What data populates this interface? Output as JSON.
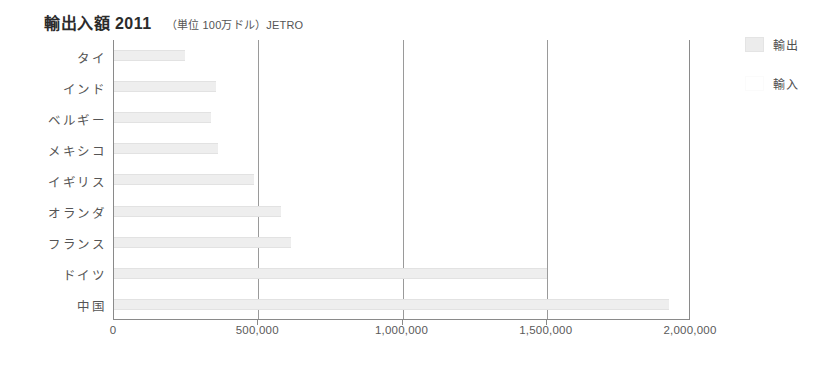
{
  "header": {
    "title": "輸出入額 2011",
    "subtitle": "（単位 100万ドル）JETRO"
  },
  "legend": {
    "position": "right",
    "items": [
      {
        "label": "輸出",
        "key": "export",
        "color": "#ececec"
      },
      {
        "label": "輸入",
        "key": "import",
        "color": "#ffffff"
      }
    ]
  },
  "chart_data": {
    "type": "bar",
    "orientation": "horizontal",
    "title": "輸出入額 2011",
    "subtitle": "（単位 100万ドル）JETRO",
    "xlabel": "",
    "ylabel": "",
    "unit": "100万ドル",
    "source": "JETRO",
    "year": "2011",
    "grid": true,
    "xlim": [
      0,
      2000000
    ],
    "xticks": [
      0,
      500000,
      1000000,
      1500000,
      2000000
    ],
    "xtick_labels": [
      "0",
      "500,000",
      "1,000,000",
      "1,500,000",
      "2,000,000"
    ],
    "categories": [
      "タイ",
      "インド",
      "ベルギー",
      "メキシコ",
      "イギリス",
      "オランダ",
      "フランス",
      "ドイツ",
      "中国"
    ],
    "series": [
      {
        "name": "輸出",
        "key": "export",
        "values": [
          245000,
          355000,
          337000,
          360000,
          486000,
          580000,
          615000,
          1500000,
          1925000
        ]
      },
      {
        "name": "輸入",
        "key": "import",
        "values": [
          0,
          0,
          0,
          0,
          0,
          0,
          0,
          0,
          0
        ]
      }
    ]
  }
}
